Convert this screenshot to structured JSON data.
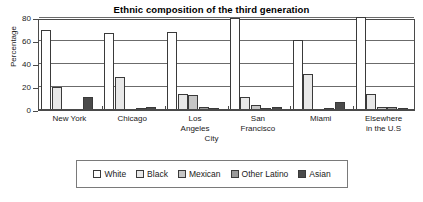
{
  "chart_data": {
    "type": "bar",
    "title": "Ethnic composition of the third generation",
    "xlabel": "City",
    "ylabel": "Percentage",
    "ylim": [
      0,
      80
    ],
    "yticks": [
      0,
      20,
      40,
      60,
      80
    ],
    "grid": true,
    "legend_position": "bottom",
    "categories": [
      "New York",
      "Chicago",
      "Los Angeles",
      "San Francisco",
      "Miami",
      "Elsewhere in the U.S"
    ],
    "category_lines": [
      [
        "New York"
      ],
      [
        "Chicago"
      ],
      [
        "Los",
        "Angeles"
      ],
      [
        "San",
        "Francisco"
      ],
      [
        "Miami"
      ],
      [
        "Elsewhere",
        "in the U.S"
      ]
    ],
    "series": [
      {
        "name": "White",
        "color": "#ffffff",
        "values": [
          70,
          67,
          68,
          80,
          61,
          81
        ]
      },
      {
        "name": "Black",
        "color": "#e8e8e8",
        "values": [
          20,
          29,
          14,
          11,
          31,
          14
        ]
      },
      {
        "name": "Mexican",
        "color": "#c6c6c6",
        "values": [
          0,
          0,
          13,
          4,
          0,
          3
        ]
      },
      {
        "name": "Other Latino",
        "color": "#9a9a9a",
        "values": [
          0,
          2,
          3,
          2,
          2,
          3
        ]
      },
      {
        "name": "Asian",
        "color": "#4a4a4a",
        "values": [
          11,
          3,
          2,
          3,
          7,
          2
        ]
      }
    ]
  }
}
